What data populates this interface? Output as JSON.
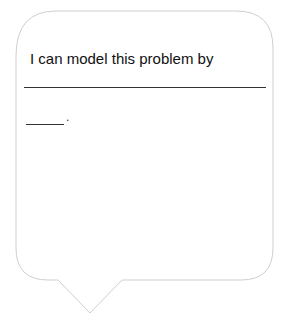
{
  "bubble": {
    "prompt_text": "I can model this problem by",
    "blank_end_punctuation": ".",
    "border_color": "#cfcfcf"
  }
}
